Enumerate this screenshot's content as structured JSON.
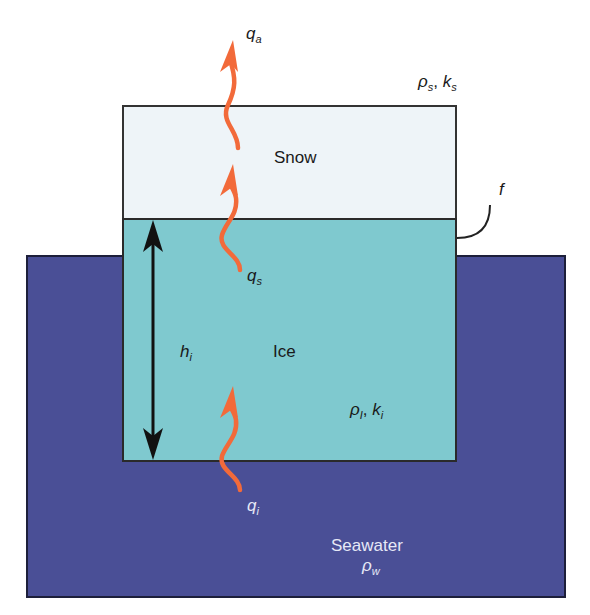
{
  "diagram": {
    "title": "",
    "layers": {
      "snow": {
        "label": "Snow",
        "properties": {
          "density_symbol": "ρ",
          "density_sub": "s",
          "conductivity_symbol": "k",
          "conductivity_sub": "s"
        },
        "color": "#eef4f8"
      },
      "ice": {
        "label": "Ice",
        "thickness_symbol": "h",
        "thickness_sub": "i",
        "properties": {
          "density_symbol": "ρ",
          "density_sub": "I",
          "conductivity_symbol": "k",
          "conductivity_sub": "i"
        },
        "color": "#7fc9cf"
      },
      "seawater": {
        "label": "Seawater",
        "density_symbol": "ρ",
        "density_sub": "w",
        "color": "#4a4f96"
      }
    },
    "fluxes": [
      {
        "id": "qa",
        "symbol": "q",
        "sub": "a",
        "description": "heat flux to atmosphere"
      },
      {
        "id": "qs",
        "symbol": "q",
        "sub": "s",
        "description": "heat flux through snow"
      },
      {
        "id": "qi",
        "symbol": "q",
        "sub": "i",
        "description": "heat flux from ocean into ice"
      }
    ],
    "freeboard": {
      "symbol": "f"
    },
    "separator": ", ",
    "arrow_color": "#f26a3a"
  }
}
